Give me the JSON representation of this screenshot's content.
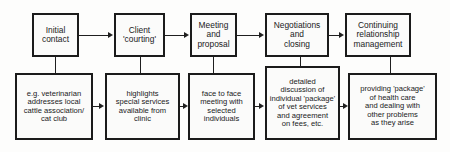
{
  "diagram": {
    "colors": {
      "line": "#1f1f1f",
      "border": "#1b1b1b",
      "box_fill": "#fbfbfa",
      "background": "#fdfdfc",
      "text": "#1a1a1a"
    },
    "stages": [
      {
        "id": "stage-1",
        "label": "Initial\ncontact"
      },
      {
        "id": "stage-2",
        "label": "Client\n'courting'"
      },
      {
        "id": "stage-3",
        "label": "Meeting\nand\nproposal"
      },
      {
        "id": "stage-4",
        "label": "Negotiations\nand\nclosing"
      },
      {
        "id": "stage-5",
        "label": "Continuing\nrelationship\nmanagement"
      }
    ],
    "details": [
      {
        "id": "detail-1",
        "label": "e.g. veterinarian\naddresses local\ncattle association/\ncat club"
      },
      {
        "id": "detail-2",
        "label": "highlights\nspecial services\navailable from\nclinic"
      },
      {
        "id": "detail-3",
        "label": "face to face\nmeeting with\nselected\nindividuals"
      },
      {
        "id": "detail-4",
        "label": "detailed\ndiscussion of\nindividual 'package'\nof vet services\nand agreement\non fees, etc."
      },
      {
        "id": "detail-5",
        "label": "providing 'package'\nof health care\nand dealing with\nother problems\nas they arise"
      }
    ]
  }
}
